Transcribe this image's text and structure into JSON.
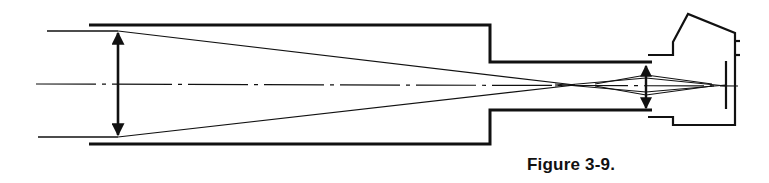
{
  "figure": {
    "caption": "Figure 3-9.",
    "line_color": "#111111",
    "background": "#ffffff"
  },
  "components": [
    {
      "name": "objective-lens",
      "type": "double-arrow lens"
    },
    {
      "name": "main-tube",
      "type": "tube outline"
    },
    {
      "name": "focuser-drawtube",
      "type": "tube outline"
    },
    {
      "name": "eyepiece-lens",
      "type": "double-arrow lens"
    },
    {
      "name": "camera-body",
      "type": "outline"
    },
    {
      "name": "film-plane",
      "type": "vertical line"
    },
    {
      "name": "optical-axis",
      "type": "dash-dot centerline"
    },
    {
      "name": "light-rays",
      "type": "converging lines"
    }
  ]
}
